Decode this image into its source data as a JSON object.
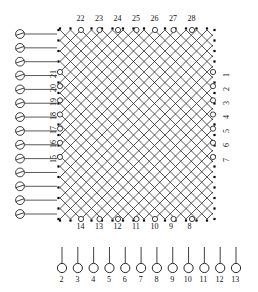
{
  "diagram": {
    "grid": {
      "type": "diagonal-lattice-mesh",
      "x0": 60,
      "y0": 30,
      "x1": 213,
      "y1": 219,
      "cell": 10.5,
      "stroke": "#222222",
      "dot_color": "#000000"
    },
    "top_nodes": {
      "labels": [
        "22",
        "23",
        "24",
        "25",
        "26",
        "27",
        "28"
      ],
      "count": 7
    },
    "bottom_nodes": {
      "labels": [
        "14",
        "13",
        "12",
        "11",
        "10",
        "9",
        "8"
      ],
      "count": 7
    },
    "right_nodes": {
      "labels": [
        "1",
        "2",
        "3",
        "4",
        "5",
        "6",
        "7"
      ],
      "count": 7
    },
    "left_inner_nodes": {
      "labels": [
        "21",
        "20",
        "19",
        "18",
        "17",
        "16",
        "15"
      ],
      "count": 7
    },
    "left_symbols": {
      "count": 14,
      "marker": "slashed-circle",
      "lead_line": true
    },
    "legend": {
      "markers": [
        "2",
        "3",
        "4",
        "5",
        "6",
        "7",
        "8",
        "9",
        "10",
        "11",
        "12",
        "13"
      ],
      "marker_shape": "circle-with-stem",
      "count": 12
    }
  }
}
